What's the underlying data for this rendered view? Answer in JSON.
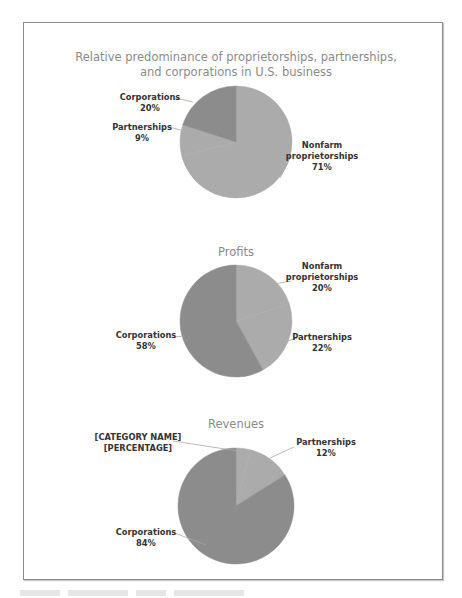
{
  "chart_data": [
    {
      "type": "pie",
      "title": "Relative predominance of proprietorships, partnerships, and corporations in U.S. business",
      "title_lines": [
        "Relative predominance of proprietorships, partnerships,",
        "and corporations in U.S. business"
      ],
      "categories": [
        "Nonfarm proprietorships",
        "Partnerships",
        "Corporations"
      ],
      "values": [
        71,
        9,
        20
      ],
      "labels": [
        {
          "name_lines": [
            "Nonfarm",
            "proprietorships"
          ],
          "pct": "71%"
        },
        {
          "name_lines": [
            "Partnerships"
          ],
          "pct": "9%"
        },
        {
          "name_lines": [
            "Corporations"
          ],
          "pct": "20%"
        }
      ],
      "colors": [
        "#ababab",
        "#ababab",
        "#8c8c8c"
      ]
    },
    {
      "type": "pie",
      "title": "Profits",
      "title_lines": [
        "Profits"
      ],
      "categories": [
        "Nonfarm proprietorships",
        "Partnerships",
        "Corporations"
      ],
      "values": [
        20,
        22,
        58
      ],
      "labels": [
        {
          "name_lines": [
            "Nonfarm",
            "proprietorships"
          ],
          "pct": "20%"
        },
        {
          "name_lines": [
            "Partnerships"
          ],
          "pct": "22%"
        },
        {
          "name_lines": [
            "Corporations"
          ],
          "pct": "58%"
        }
      ],
      "colors": [
        "#ababab",
        "#ababab",
        "#8c8c8c"
      ]
    },
    {
      "type": "pie",
      "title": "Revenues",
      "title_lines": [
        "Revenues"
      ],
      "categories": [
        "[CATEGORY NAME]",
        "Partnerships",
        "Corporations"
      ],
      "values": [
        4,
        12,
        84
      ],
      "labels": [
        {
          "name_lines": [
            "[CATEGORY NAME]"
          ],
          "pct": "[PERCENTAGE]"
        },
        {
          "name_lines": [
            "Partnerships"
          ],
          "pct": "12%"
        },
        {
          "name_lines": [
            "Corporations"
          ],
          "pct": "84%"
        }
      ],
      "colors": [
        "#ababab",
        "#ababab",
        "#8c8c8c"
      ]
    }
  ],
  "charts": {
    "c1": {
      "title1": "Relative predominance of proprietorships, partnerships,",
      "title2": "and corporations in U.S. business",
      "nonfarm1": "Nonfarm",
      "nonfarm2": "proprietorships",
      "nonfarm_pct": "71%",
      "partnerships": "Partnerships",
      "partnerships_pct": "9%",
      "corporations": "Corporations",
      "corporations_pct": "20%"
    },
    "c2": {
      "title": "Profits",
      "nonfarm1": "Nonfarm",
      "nonfarm2": "proprietorships",
      "nonfarm_pct": "20%",
      "partnerships": "Partnerships",
      "partnerships_pct": "22%",
      "corporations": "Corporations",
      "corporations_pct": "58%"
    },
    "c3": {
      "title": "Revenues",
      "placeholder_name": "[CATEGORY NAME]",
      "placeholder_pct": "[PERCENTAGE]",
      "partnerships": "Partnerships",
      "partnerships_pct": "12%",
      "corporations": "Corporations",
      "corporations_pct": "84%"
    }
  },
  "colors": {
    "light_slice": "#ababab",
    "dark_slice": "#8c8c8c",
    "title": "#8a8a8a",
    "label": "#333333",
    "frame": "#8a8a8a"
  }
}
